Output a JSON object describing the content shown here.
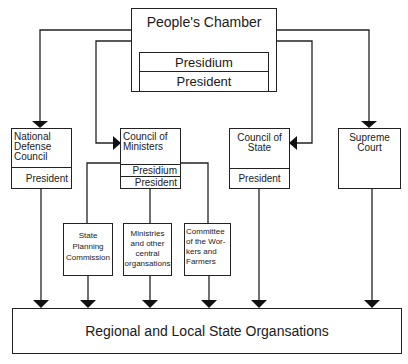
{
  "diagram": {
    "peoples_chamber": {
      "title": "People's Chamber",
      "presidium": "Presidium",
      "president": "President"
    },
    "national_defense_council": {
      "title_lines": [
        "National",
        "Defense",
        "Council"
      ],
      "president": "President"
    },
    "council_of_ministers": {
      "title_lines": [
        "Council of",
        "Ministers"
      ],
      "presidium": "Presidium",
      "president": "President"
    },
    "council_of_state": {
      "title_lines": [
        "Council of",
        "State"
      ],
      "president": "President"
    },
    "supreme_court": {
      "title_lines": [
        "Supreme",
        "Court"
      ]
    },
    "state_planning_commission": {
      "lines": [
        "State",
        "Planning",
        "Commission"
      ]
    },
    "ministries": {
      "lines": [
        "Ministries",
        "and other",
        "central",
        "organsations"
      ]
    },
    "committee": {
      "lines": [
        "Committee",
        "of the Wor-",
        "kers and",
        "Farmers"
      ]
    },
    "regional": {
      "title": "Regional and Local State Organsations"
    }
  }
}
